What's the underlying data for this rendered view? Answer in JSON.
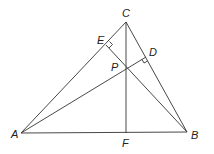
{
  "diagram": {
    "type": "triangle-orthocenter",
    "points": [
      "A",
      "B",
      "C",
      "D",
      "E",
      "F",
      "P"
    ],
    "segments": [
      "AB",
      "BC",
      "CA",
      "CF",
      "AD",
      "BE"
    ],
    "right_angles": [
      "D",
      "E"
    ],
    "labels": {
      "A": "A",
      "B": "B",
      "C": "C",
      "D": "D",
      "E": "E",
      "F": "F",
      "P": "P"
    }
  }
}
